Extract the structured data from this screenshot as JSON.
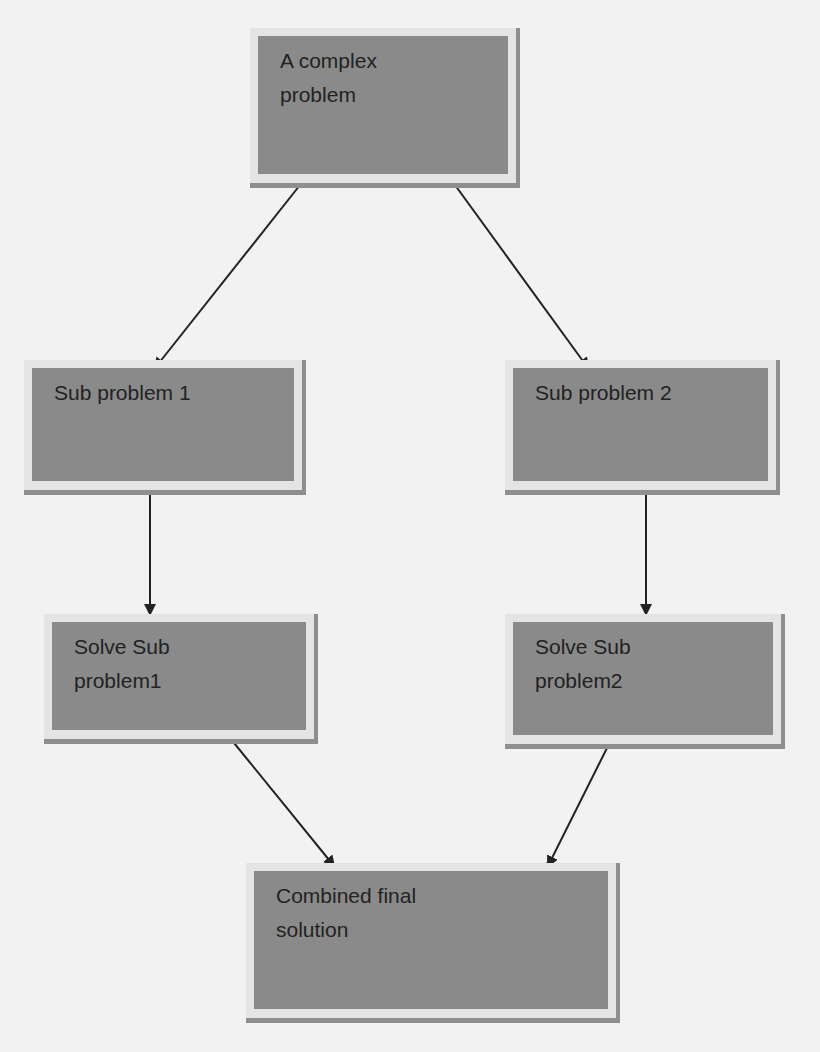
{
  "diagram": {
    "type": "flowchart",
    "title": "",
    "colors": {
      "background": "#f2f2f2",
      "node_fill": "#8a8a8a",
      "node_frame": "#e4e4e4",
      "node_shadow": "#8e8e8e",
      "text": "#222222",
      "edge": "#222222"
    },
    "nodes": [
      {
        "id": "complex",
        "label": "A complex\nproblem",
        "x": 250,
        "y": 28,
        "w": 270,
        "h": 160
      },
      {
        "id": "sub1",
        "label": "Sub problem 1",
        "x": 24,
        "y": 360,
        "w": 282,
        "h": 135
      },
      {
        "id": "sub2",
        "label": "Sub problem 2",
        "x": 505,
        "y": 360,
        "w": 275,
        "h": 135
      },
      {
        "id": "solve1",
        "label": "Solve Sub\nproblem1",
        "x": 44,
        "y": 614,
        "w": 274,
        "h": 130
      },
      {
        "id": "solve2",
        "label": "Solve Sub\nproblem2",
        "x": 505,
        "y": 614,
        "w": 280,
        "h": 135
      },
      {
        "id": "final",
        "label": "Combined final\nsolution",
        "x": 246,
        "y": 863,
        "w": 374,
        "h": 160
      }
    ],
    "edges": [
      {
        "from": "complex",
        "to": "sub1",
        "x1": 300,
        "y1": 185,
        "x2": 155,
        "y2": 368
      },
      {
        "from": "complex",
        "to": "sub2",
        "x1": 455,
        "y1": 185,
        "x2": 588,
        "y2": 368
      },
      {
        "from": "sub1",
        "to": "solve1",
        "x1": 150,
        "y1": 487,
        "x2": 150,
        "y2": 614
      },
      {
        "from": "sub2",
        "to": "solve2",
        "x1": 646,
        "y1": 487,
        "x2": 646,
        "y2": 614
      },
      {
        "from": "solve1",
        "to": "final",
        "x1": 230,
        "y1": 738,
        "x2": 334,
        "y2": 866
      },
      {
        "from": "solve2",
        "to": "final",
        "x1": 612,
        "y1": 738,
        "x2": 548,
        "y2": 866,
        "handles": true
      }
    ]
  }
}
